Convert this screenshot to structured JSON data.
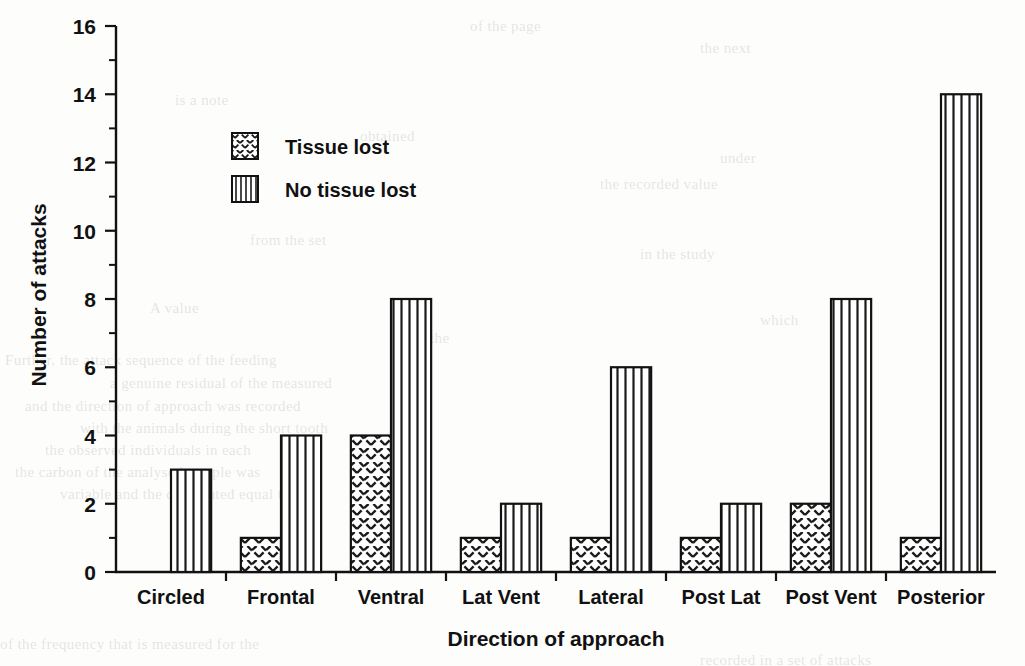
{
  "chart_data": {
    "type": "bar",
    "title": "",
    "subtitle": "",
    "xlabel": "Direction of approach",
    "ylabel": "Number of attacks",
    "categories": [
      "Circled",
      "Frontal",
      "Ventral",
      "Lat Vent",
      "Lateral",
      "Post Lat",
      "Post Vent",
      "Posterior"
    ],
    "series": [
      {
        "name": "Tissue lost",
        "values": [
          0,
          1,
          4,
          1,
          1,
          1,
          2,
          1
        ],
        "pattern": "crosshatch-dashes"
      },
      {
        "name": "No tissue lost",
        "values": [
          3,
          4,
          8,
          2,
          6,
          2,
          8,
          14
        ],
        "pattern": "vertical-lines"
      }
    ],
    "ylim": [
      0,
      16
    ],
    "yticks": [
      0,
      2,
      4,
      6,
      8,
      10,
      12,
      14,
      16
    ],
    "yticklabels": [
      "0",
      "2",
      "4",
      "6",
      "8",
      "10",
      "12",
      "14",
      "16"
    ],
    "yminorticks": [
      1,
      3,
      5,
      7,
      9,
      11,
      13,
      15
    ],
    "grid": false,
    "legend_position": "upper-left-inside",
    "bar_fill": "#ffffff",
    "bar_stroke": "#111111",
    "background": "#fdfdfc"
  },
  "axes": {
    "y_title": "Number of attacks",
    "x_title": "Direction of approach",
    "y_tick_labels": [
      "0",
      "2",
      "4",
      "6",
      "8",
      "10",
      "12",
      "14",
      "16"
    ]
  },
  "legend": {
    "items": [
      {
        "label": "Tissue lost",
        "swatch": "crosshatch-swatch"
      },
      {
        "label": "No tissue lost",
        "swatch": "vertical-lines-swatch"
      }
    ]
  },
  "ghost_text": [
    {
      "text": "of the page",
      "x": 470,
      "y": 18
    },
    {
      "text": "the next",
      "x": 700,
      "y": 40
    },
    {
      "text": "is a note",
      "x": 175,
      "y": 92
    },
    {
      "text": "obtained",
      "x": 360,
      "y": 128
    },
    {
      "text": "under",
      "x": 720,
      "y": 150
    },
    {
      "text": "the recorded value",
      "x": 600,
      "y": 176
    },
    {
      "text": "from the set",
      "x": 250,
      "y": 232
    },
    {
      "text": "in the study",
      "x": 640,
      "y": 246
    },
    {
      "text": "A value",
      "x": 150,
      "y": 300
    },
    {
      "text": "which",
      "x": 760,
      "y": 312
    },
    {
      "text": "the",
      "x": 430,
      "y": 330
    },
    {
      "text": "Further, the attack sequence of the feeding",
      "x": 5,
      "y": 352
    },
    {
      "text": "a genuine residual of the measured",
      "x": 110,
      "y": 375
    },
    {
      "text": "and the direction of approach was recorded",
      "x": 25,
      "y": 398
    },
    {
      "text": "with the animals during the short tooth",
      "x": 80,
      "y": 420
    },
    {
      "text": "the observed individuals in each",
      "x": 45,
      "y": 442
    },
    {
      "text": "the carbon of the analysed sample was",
      "x": 15,
      "y": 464
    },
    {
      "text": "variable and the distributed equal to",
      "x": 60,
      "y": 486
    },
    {
      "text": "of the frequency that is measured for the",
      "x": 0,
      "y": 636
    },
    {
      "text": "recorded in a set of attacks",
      "x": 700,
      "y": 652
    }
  ]
}
